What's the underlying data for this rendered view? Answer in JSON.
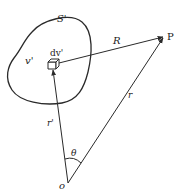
{
  "diagram": {
    "type": "vector-geometry",
    "labels": {
      "surface": "S'",
      "volume": "v'",
      "volume_element": "dv'",
      "separation": "R",
      "field_point": "P",
      "field_position": "r",
      "source_position": "r'",
      "origin": "o",
      "angle": "θ"
    },
    "points": {
      "origin": [
        68,
        183
      ],
      "volume_element": [
        53,
        67
      ],
      "field_point": [
        163,
        37
      ]
    },
    "colors": {
      "line": "#2a2a2a",
      "background": "#ffffff"
    }
  }
}
